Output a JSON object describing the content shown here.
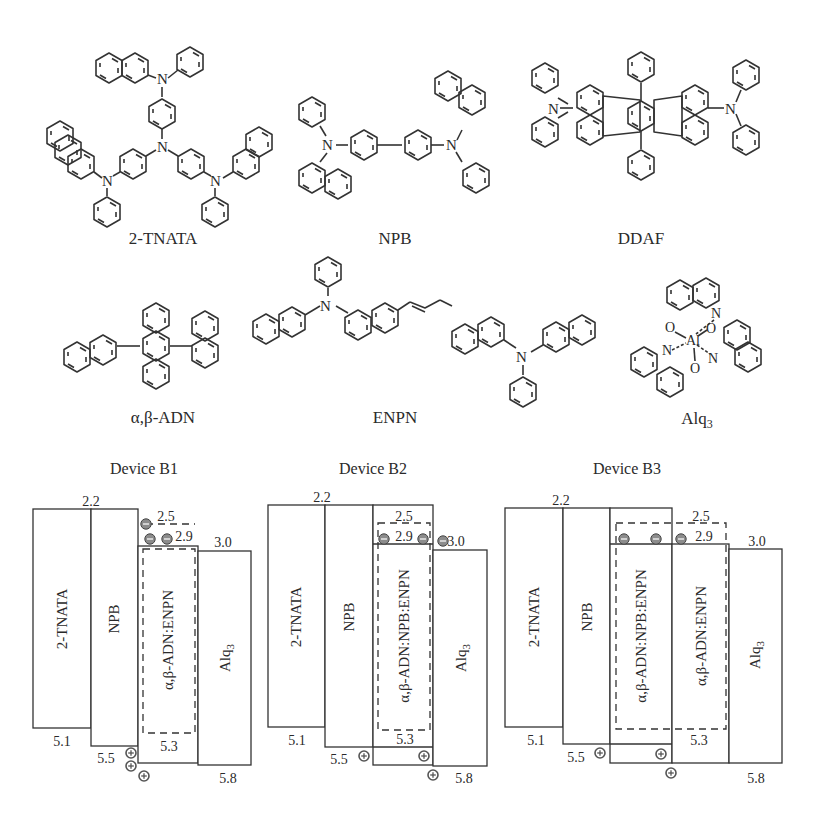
{
  "molecules": [
    {
      "id": "tnata",
      "label": "2-TNATA"
    },
    {
      "id": "npb",
      "label": "NPB"
    },
    {
      "id": "ddaf",
      "label": "DDAF"
    },
    {
      "id": "adn",
      "label": "α,β-ADN"
    },
    {
      "id": "enpn",
      "label": "ENPN"
    },
    {
      "id": "alq3",
      "label": "Alq",
      "label_sub": "3"
    }
  ],
  "atoms": {
    "N": "N",
    "O": "O",
    "Al": "Al"
  },
  "devices": [
    {
      "title": "Device B1",
      "layers": [
        {
          "name": "2-TNATA",
          "lumo": "2.2",
          "homo": "5.1"
        },
        {
          "name": "NPB",
          "lumo": "2.2",
          "homo": "5.5"
        },
        {
          "name": "α,β-ADN:ENPN",
          "lumo": "2.9",
          "homo": "5.3",
          "dopant_lumo": "2.5"
        },
        {
          "name": "Alq",
          "name_sub": "3",
          "lumo": "3.0",
          "homo": "5.8"
        }
      ],
      "labels": {
        "lumo_htl": "2.2",
        "dopant": "2.5",
        "eml_lumo": "2.9",
        "etl_lumo": "3.0",
        "tnata_homo": "5.1",
        "npb_homo": "5.5",
        "eml_homo": "5.3",
        "etl_homo": "5.8"
      }
    },
    {
      "title": "Device B2",
      "layers": [
        {
          "name": "2-TNATA",
          "lumo": "2.2",
          "homo": "5.1"
        },
        {
          "name": "NPB",
          "lumo": "2.2",
          "homo": "5.5"
        },
        {
          "name": "α,β-ADN:NPB:ENPN",
          "lumo": "2.9",
          "homo": "5.3",
          "dopant_lumo": "2.5"
        },
        {
          "name": "Alq",
          "name_sub": "3",
          "lumo": "3.0",
          "homo": "5.8"
        }
      ],
      "labels": {
        "lumo_htl": "2.2",
        "dopant": "2.5",
        "eml_lumo": "2.9",
        "etl_lumo": "3.0",
        "tnata_homo": "5.1",
        "npb_homo": "5.5",
        "eml_homo": "5.3",
        "etl_homo": "5.8"
      }
    },
    {
      "title": "Device B3",
      "layers": [
        {
          "name": "2-TNATA",
          "lumo": "2.2",
          "homo": "5.1"
        },
        {
          "name": "NPB",
          "lumo": "2.2",
          "homo": "5.5"
        },
        {
          "name": "α,β-ADN:NPB:ENPN",
          "lumo": "2.9",
          "homo": "5.5",
          "dopant_lumo": "2.5"
        },
        {
          "name": "α,β-ADN:ENPN",
          "lumo": "2.9",
          "homo": "5.3",
          "dopant_lumo": "2.5"
        },
        {
          "name": "Alq",
          "name_sub": "3",
          "lumo": "3.0",
          "homo": "5.8"
        }
      ],
      "labels": {
        "lumo_htl": "2.2",
        "dopant": "2.5",
        "eml_lumo": "2.9",
        "etl_lumo": "3.0",
        "tnata_homo": "5.1",
        "npb_homo": "5.5",
        "eml_homo": "5.3",
        "etl_homo": "5.8"
      }
    }
  ],
  "carriers": {
    "electron": "⊖",
    "hole": "⊕"
  },
  "colors": {
    "line": "#333333",
    "carrier_fill": "#8a8a8a",
    "background": "#ffffff"
  }
}
